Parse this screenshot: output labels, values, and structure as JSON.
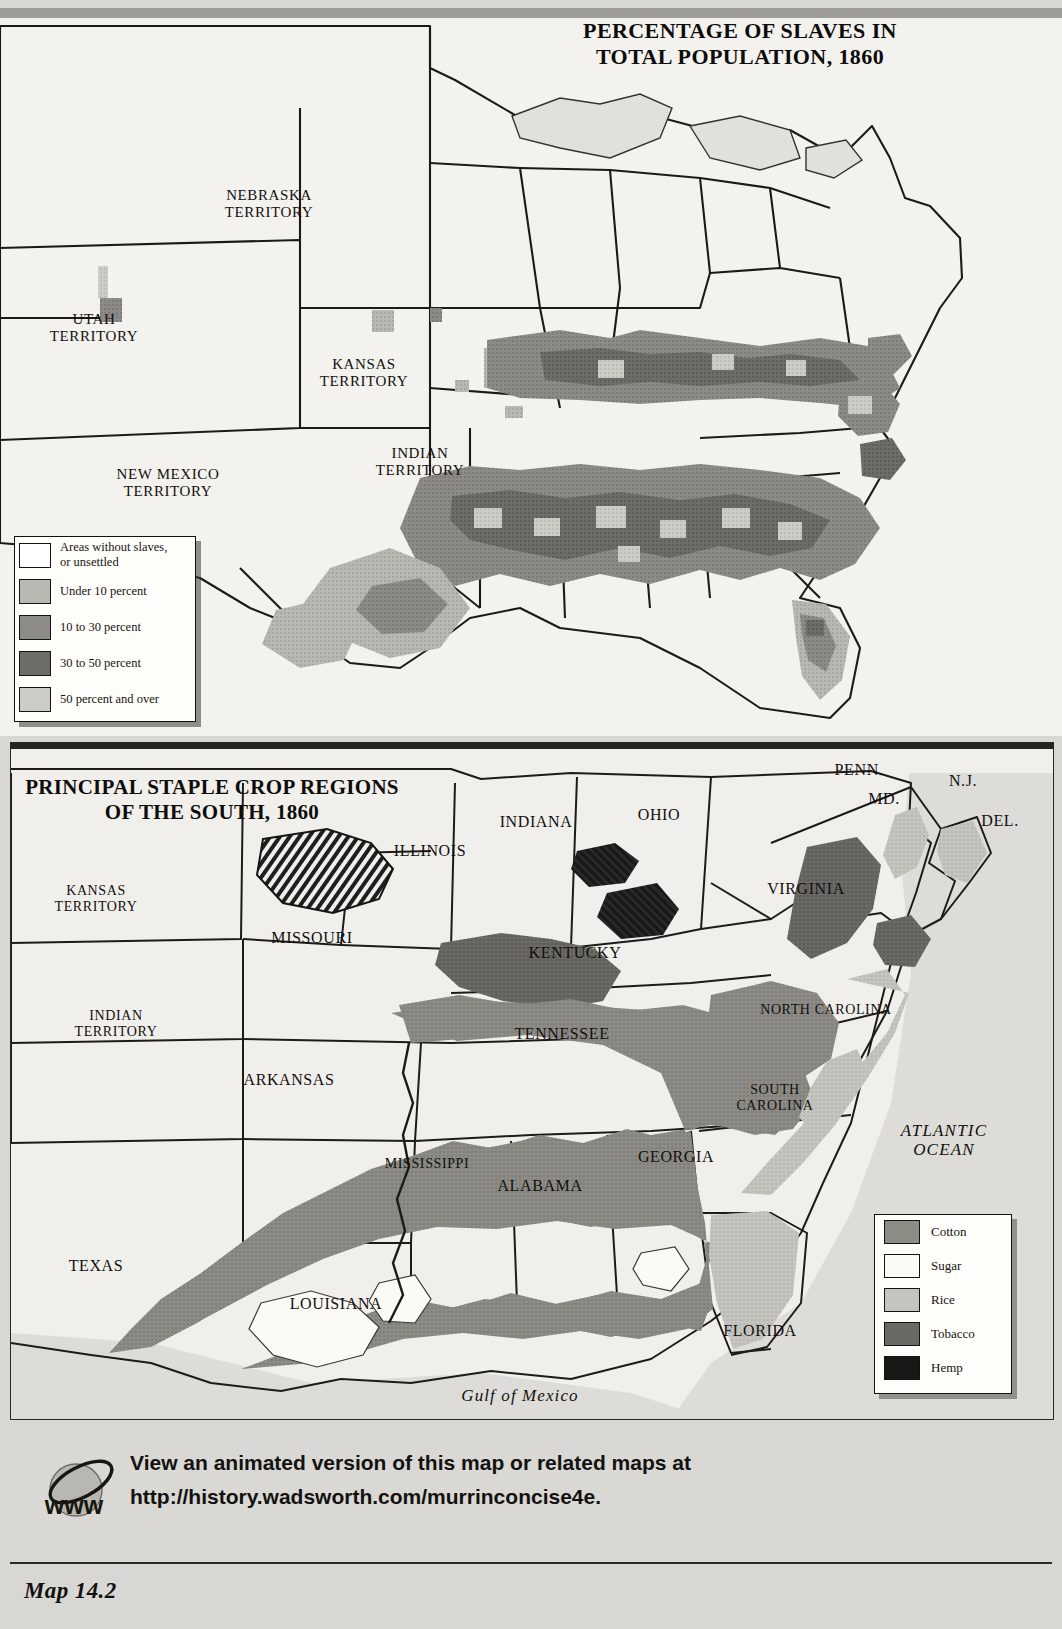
{
  "page": {
    "caption": "Map 14.2",
    "background_color": "#d8d7d3"
  },
  "top_map": {
    "title_line1": "PERCENTAGE OF SLAVES IN",
    "title_line2": "TOTAL POPULATION, 1860",
    "legend": {
      "name": "slave-percentage-legend",
      "items": [
        {
          "label": "Areas without slaves,\nor unsettled",
          "color": "#ffffff"
        },
        {
          "label": "Under 10 percent",
          "color": "#b9b7b2"
        },
        {
          "label": "10 to 30 percent",
          "color": "#8d8b86"
        },
        {
          "label": "30 to 50 percent",
          "color": "#6e6c68"
        },
        {
          "label": "50 percent and over",
          "color": "#cdcbc6"
        }
      ]
    },
    "labels": [
      {
        "text": "NEBRASKA\nTERRITORY",
        "x": 269,
        "y": 196
      },
      {
        "text": "UTAH\nTERRITORY",
        "x": 94,
        "y": 320
      },
      {
        "text": "KANSAS\nTERRITORY",
        "x": 364,
        "y": 365
      },
      {
        "text": "INDIAN\nTERRITORY",
        "x": 420,
        "y": 454
      },
      {
        "text": "NEW MEXICO\nTERRITORY",
        "x": 168,
        "y": 475
      }
    ]
  },
  "bottom_map": {
    "title_line1": "PRINCIPAL STAPLE CROP REGIONS",
    "title_line2": "OF THE SOUTH, 1860",
    "ocean_label": "ATLANTIC\nOCEAN",
    "gulf_label": "Gulf of Mexico",
    "legend": {
      "name": "staple-crop-legend",
      "items": [
        {
          "label": "Cotton",
          "color": "#8d8b86"
        },
        {
          "label": "Sugar",
          "color": "#fbfaf7"
        },
        {
          "label": "Rice",
          "color": "#c6c4bf"
        },
        {
          "label": "Tobacco",
          "color": "#6b6965"
        },
        {
          "label": "Hemp",
          "color": "#191817"
        }
      ]
    },
    "labels": [
      {
        "text": "KANSAS\nTERRITORY",
        "x": 96,
        "y": 899
      },
      {
        "text": "MISSOURI",
        "x": 312,
        "y": 938
      },
      {
        "text": "ILLINOIS",
        "x": 430,
        "y": 851
      },
      {
        "text": "INDIANA",
        "x": 536,
        "y": 822
      },
      {
        "text": "OHIO",
        "x": 659,
        "y": 815
      },
      {
        "text": "PENN.",
        "x": 859,
        "y": 770
      },
      {
        "text": "N.J.",
        "x": 963,
        "y": 781
      },
      {
        "text": "MD.",
        "x": 884,
        "y": 799
      },
      {
        "text": "DEL.",
        "x": 1000,
        "y": 821
      },
      {
        "text": "VIRGINIA",
        "x": 806,
        "y": 889
      },
      {
        "text": "KENTUCKY",
        "x": 575,
        "y": 953
      },
      {
        "text": "INDIAN\nTERRITORY",
        "x": 116,
        "y": 1024
      },
      {
        "text": "NORTH CAROLINA",
        "x": 826,
        "y": 1010
      },
      {
        "text": "TENNESSEE",
        "x": 562,
        "y": 1034
      },
      {
        "text": "ARKANSAS",
        "x": 289,
        "y": 1080
      },
      {
        "text": "SOUTH\nCAROLINA",
        "x": 775,
        "y": 1098
      },
      {
        "text": "GEORGIA",
        "x": 676,
        "y": 1157
      },
      {
        "text": "MISSISSIPPI",
        "x": 427,
        "y": 1164
      },
      {
        "text": "ALABAMA",
        "x": 540,
        "y": 1186
      },
      {
        "text": "TEXAS",
        "x": 96,
        "y": 1266
      },
      {
        "text": "LOUISIANA",
        "x": 336,
        "y": 1304
      },
      {
        "text": "FLORIDA",
        "x": 760,
        "y": 1331
      }
    ]
  },
  "footer": {
    "icon_label": "www",
    "line1": "View an animated version of this map or related maps at",
    "line2": "http://history.wadsworth.com/murrinconcise4e."
  }
}
